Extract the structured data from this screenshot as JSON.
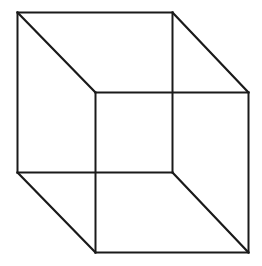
{
  "diagram": {
    "type": "wireframe-cube",
    "colors": {
      "background": "#ffffff",
      "stroke": "#1a1a1a"
    },
    "back_face": {
      "x1": 17.5,
      "y1": 12.5,
      "x2": 172.5,
      "y2": 172.5
    },
    "front_face": {
      "x1": 95.5,
      "y1": 92.5,
      "x2": 248.5,
      "y2": 252.5
    }
  }
}
